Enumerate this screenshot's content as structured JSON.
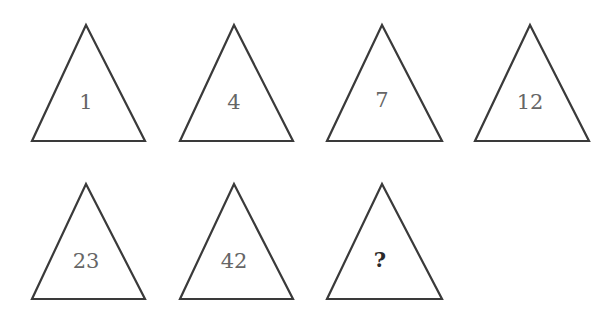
{
  "puzzle": {
    "shape": "triangle",
    "triangles": [
      {
        "value": "1"
      },
      {
        "value": "4"
      },
      {
        "value": "7"
      },
      {
        "value": "12"
      },
      {
        "value": "23"
      },
      {
        "value": "42"
      },
      {
        "value": "?"
      }
    ]
  }
}
